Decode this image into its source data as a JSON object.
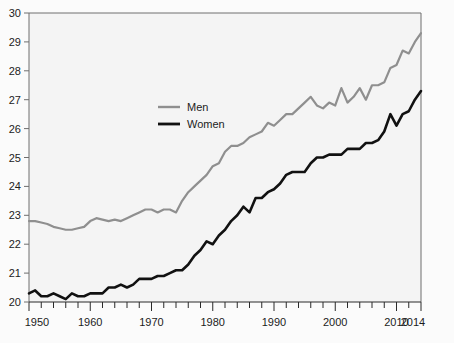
{
  "chart_data": {
    "type": "line",
    "title": "",
    "subtitle": "",
    "xlabel": "",
    "ylabel": "",
    "xlim": [
      1950,
      2014
    ],
    "ylim": [
      20,
      30
    ],
    "grid": false,
    "legend_position": "inside-upper-center",
    "y_ticks": [
      20,
      21,
      22,
      23,
      24,
      25,
      26,
      27,
      28,
      29,
      30
    ],
    "x_ticks": [
      1950,
      1960,
      1970,
      1980,
      1990,
      2000,
      2010,
      2014
    ],
    "x_minor_tick_step": 2,
    "shaded_bands": [
      {
        "start": 1959,
        "end": 1969
      },
      {
        "start": 1980,
        "end": 1991
      },
      {
        "start": 2001,
        "end": 2012
      }
    ],
    "colors": {
      "men": "#8f8f8f",
      "women": "#111111",
      "band": "#e0e0e0",
      "plot_background": "#f4f4f4",
      "axis": "#6e6e6e"
    },
    "x": [
      1950,
      1951,
      1952,
      1953,
      1954,
      1955,
      1956,
      1957,
      1958,
      1959,
      1960,
      1961,
      1962,
      1963,
      1964,
      1965,
      1966,
      1967,
      1968,
      1969,
      1970,
      1971,
      1972,
      1973,
      1974,
      1975,
      1976,
      1977,
      1978,
      1979,
      1980,
      1981,
      1982,
      1983,
      1984,
      1985,
      1986,
      1987,
      1988,
      1989,
      1990,
      1991,
      1992,
      1993,
      1994,
      1995,
      1996,
      1997,
      1998,
      1999,
      2000,
      2001,
      2002,
      2003,
      2004,
      2005,
      2006,
      2007,
      2008,
      2009,
      2010,
      2011,
      2012,
      2013,
      2014
    ],
    "series": [
      {
        "name": "Men",
        "color": "#8f8f8f",
        "values": [
          22.8,
          22.8,
          22.75,
          22.7,
          22.6,
          22.55,
          22.5,
          22.5,
          22.55,
          22.6,
          22.8,
          22.9,
          22.85,
          22.8,
          22.85,
          22.8,
          22.9,
          23.0,
          23.1,
          23.2,
          23.2,
          23.1,
          23.2,
          23.2,
          23.1,
          23.5,
          23.8,
          24.0,
          24.2,
          24.4,
          24.7,
          24.8,
          25.2,
          25.4,
          25.4,
          25.5,
          25.7,
          25.8,
          25.9,
          26.2,
          26.1,
          26.3,
          26.5,
          26.5,
          26.7,
          26.9,
          27.1,
          26.8,
          26.7,
          26.9,
          26.8,
          27.4,
          26.9,
          27.1,
          27.4,
          27.0,
          27.5,
          27.5,
          27.6,
          28.1,
          28.2,
          28.7,
          28.6,
          29.0,
          29.3
        ]
      },
      {
        "name": "Women",
        "color": "#111111",
        "values": [
          20.3,
          20.4,
          20.2,
          20.2,
          20.3,
          20.2,
          20.1,
          20.3,
          20.2,
          20.2,
          20.3,
          20.3,
          20.3,
          20.5,
          20.5,
          20.6,
          20.5,
          20.6,
          20.8,
          20.8,
          20.8,
          20.9,
          20.9,
          21.0,
          21.1,
          21.1,
          21.3,
          21.6,
          21.8,
          22.1,
          22.0,
          22.3,
          22.5,
          22.8,
          23.0,
          23.3,
          23.1,
          23.6,
          23.6,
          23.8,
          23.9,
          24.1,
          24.4,
          24.5,
          24.5,
          24.5,
          24.8,
          25.0,
          25.0,
          25.1,
          25.1,
          25.1,
          25.3,
          25.3,
          25.3,
          25.5,
          25.5,
          25.6,
          25.9,
          26.5,
          26.1,
          26.5,
          26.6,
          27.0,
          27.3
        ]
      }
    ],
    "legend": [
      {
        "label": "Men",
        "color": "#8f8f8f"
      },
      {
        "label": "Women",
        "color": "#111111"
      }
    ]
  }
}
